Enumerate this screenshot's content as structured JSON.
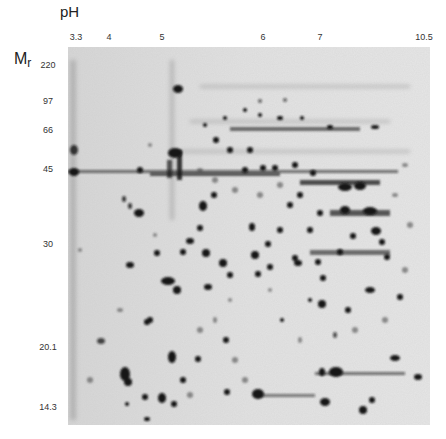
{
  "figure": {
    "type": "2D gel electrophoresis",
    "x_axis": {
      "title": "pH",
      "ticks": [
        {
          "label": "3.3",
          "x": 76
        },
        {
          "label": "4",
          "x": 109
        },
        {
          "label": "5",
          "x": 162
        },
        {
          "label": "6",
          "x": 263
        },
        {
          "label": "7",
          "x": 320
        },
        {
          "label": "10.5",
          "x": 424
        }
      ]
    },
    "y_axis": {
      "title": "M",
      "title_sub": "r",
      "ticks": [
        {
          "label": "220",
          "y": 65
        },
        {
          "label": "97",
          "y": 101
        },
        {
          "label": "66",
          "y": 130
        },
        {
          "label": "45",
          "y": 169
        },
        {
          "label": "30",
          "y": 244
        },
        {
          "label": "20.1",
          "y": 347
        },
        {
          "label": "14.3",
          "y": 407
        }
      ]
    },
    "colors": {
      "gel_background": "#dcdcdc",
      "spot": "#141414",
      "page_background": "#ffffff"
    }
  }
}
